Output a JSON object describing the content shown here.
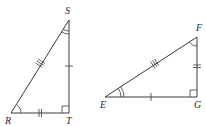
{
  "diagram": {
    "triangles": [
      {
        "name": "RST",
        "vertices": [
          "R",
          "S",
          "T"
        ],
        "right_angle_at": "T",
        "labels": {
          "R": "R",
          "S": "S",
          "T": "T"
        },
        "side_marks": {
          "RS": 3,
          "ST": 1,
          "RT": 2
        },
        "angle_arcs": {
          "R": 1,
          "S": 2
        }
      },
      {
        "name": "EFG",
        "vertices": [
          "E",
          "F",
          "G"
        ],
        "right_angle_at": "G",
        "labels": {
          "E": "E",
          "F": "F",
          "G": "G"
        },
        "side_marks": {
          "EF": 3,
          "FG": 2,
          "EG": 1
        },
        "angle_arcs": {
          "F": 1,
          "E": 2
        }
      }
    ],
    "line_color": "#3a3a3a"
  }
}
